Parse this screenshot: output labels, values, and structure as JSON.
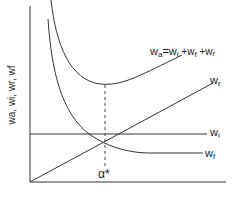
{
  "diagram": {
    "y_axis_label": "wa, wi, wr, wf",
    "x_axis_label": "",
    "curves": {
      "wa": {
        "base": "w",
        "sub": "a",
        "eq": "=w",
        "eq_sub": "i",
        "plus1": " +w",
        "plus1_sub": "f",
        "plus2": " +w",
        "plus2_sub": "r"
      },
      "wr": {
        "base": "w",
        "sub": "r"
      },
      "wi": {
        "base": "w",
        "sub": "i"
      },
      "wf": {
        "base": "w",
        "sub": "f"
      }
    },
    "optimum_label": "α*",
    "colors": {
      "line": "#333333",
      "text": "#222222",
      "background": "#ffffff"
    }
  }
}
